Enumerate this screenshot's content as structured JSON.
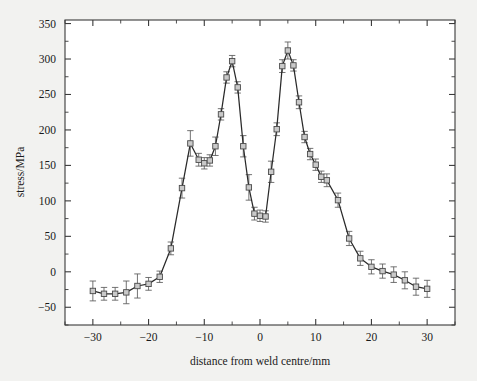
{
  "chart_data": {
    "type": "line",
    "title": "",
    "subtitle": "",
    "xlabel": "distance from weld centre/mm",
    "ylabel": "stress/MPa",
    "xlim": [
      -35,
      35
    ],
    "ylim": [
      -75,
      355
    ],
    "xticks": [
      -30,
      -20,
      -10,
      0,
      10,
      20,
      30
    ],
    "xticklabels": [
      "−30",
      "−20",
      "−10",
      "0",
      "10",
      "20",
      "30"
    ],
    "xminor_step": 5,
    "yticks": [
      -50,
      0,
      50,
      100,
      150,
      200,
      250,
      300,
      350
    ],
    "yticklabels": [
      "−50",
      "0",
      "50",
      "100",
      "150",
      "200",
      "250",
      "300",
      "350"
    ],
    "yminor_step": 25,
    "grid": false,
    "legend": null,
    "marker": "square",
    "marker_fill": "#c9c9c9",
    "line_color": "#2a2a2a",
    "errorbar_color": "#5a5a5a",
    "background": "#f2f2f0",
    "plot_background": "#ffffff",
    "series": [
      {
        "name": "residual stress",
        "x": [
          -30,
          -28,
          -26,
          -24,
          -22,
          -20,
          -18,
          -16,
          -14,
          -12.5,
          -11,
          -10,
          -9,
          -8,
          -7,
          -6,
          -5,
          -4,
          -3,
          -2,
          -1,
          0,
          1,
          2,
          3,
          4,
          5,
          6,
          7,
          8,
          9,
          10,
          11,
          12,
          14,
          16,
          18,
          20,
          22,
          24,
          26,
          28,
          30
        ],
        "y": [
          -27,
          -31,
          -31,
          -29,
          -20,
          -17,
          -7,
          33,
          118,
          181,
          158,
          153,
          157,
          177,
          222,
          274,
          297,
          260,
          177,
          119,
          82,
          79,
          78,
          141,
          201,
          290,
          312,
          291,
          239,
          190,
          166,
          151,
          134,
          129,
          101,
          47,
          19,
          7,
          1,
          -4,
          -12,
          -21,
          -24
        ],
        "yerr": [
          14,
          9,
          9,
          16,
          17,
          9,
          8,
          9,
          14,
          18,
          9,
          8,
          8,
          13,
          8,
          8,
          8,
          8,
          15,
          18,
          9,
          8,
          8,
          15,
          9,
          9,
          12,
          8,
          9,
          8,
          8,
          8,
          8,
          9,
          10,
          10,
          10,
          10,
          10,
          11,
          12,
          12,
          12
        ]
      }
    ]
  },
  "axes": {
    "x_label": "distance from weld centre/mm",
    "y_label": "stress/MPa"
  }
}
